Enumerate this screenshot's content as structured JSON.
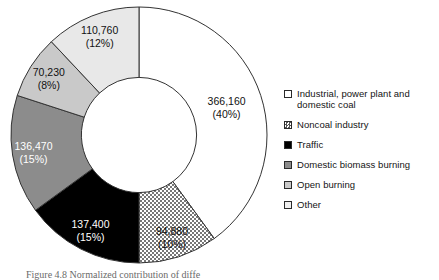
{
  "figure": {
    "caption": "Figure 4.8  Normalized contribution of diffe"
  },
  "chart_data": {
    "type": "pie",
    "variant": "donut",
    "title": "",
    "xlabel": "",
    "ylabel": "",
    "total": 915900,
    "units": "tons per year",
    "start_angle_deg": 0,
    "direction": "clockwise",
    "inner_radius_ratio": 0.45,
    "legend_position": "right",
    "grid": false,
    "categories": [
      "Industrial, power plant and domestic coal",
      "Noncoal industry",
      "Traffic",
      "Domestic biomass burning",
      "Open burning",
      "Other"
    ],
    "values": [
      366160,
      94880,
      137400,
      136470,
      70230,
      110760
    ],
    "percents": [
      40,
      10,
      15,
      15,
      8,
      12
    ],
    "value_labels": [
      "366,160",
      "94,880",
      "137,400",
      "136,470",
      "70,230",
      "110,760"
    ],
    "percent_labels": [
      "(40%)",
      "(10%)",
      "(15%)",
      "(15%)",
      "(8%)",
      "(12%)"
    ],
    "fills": [
      "#ffffff",
      "stipple",
      "#000000",
      "#8c8c8c",
      "#c9c9c9",
      "#e8e8e8"
    ],
    "label_text_colors": [
      "#111111",
      "#111111",
      "#ffffff",
      "#ffffff",
      "#111111",
      "#111111"
    ],
    "stroke": "#333333"
  },
  "legend": {
    "items": [
      {
        "label": "Industrial, power plant and",
        "label2": "domestic coal",
        "swatch": "white-swatch",
        "fill": "#ffffff"
      },
      {
        "label": "Noncoal industry",
        "label2": "",
        "swatch": "stipple-swatch",
        "fill": "stipple"
      },
      {
        "label": "Traffic",
        "label2": "",
        "swatch": "black-swatch",
        "fill": "#000000"
      },
      {
        "label": "Domestic biomass burning",
        "label2": "",
        "swatch": "dark-gray-swatch",
        "fill": "#8c8c8c"
      },
      {
        "label": "Open burning",
        "label2": "",
        "swatch": "light-gray-swatch",
        "fill": "#c9c9c9"
      },
      {
        "label": "Other",
        "label2": "",
        "swatch": "very-light-gray-swatch",
        "fill": "#efefef"
      }
    ]
  }
}
